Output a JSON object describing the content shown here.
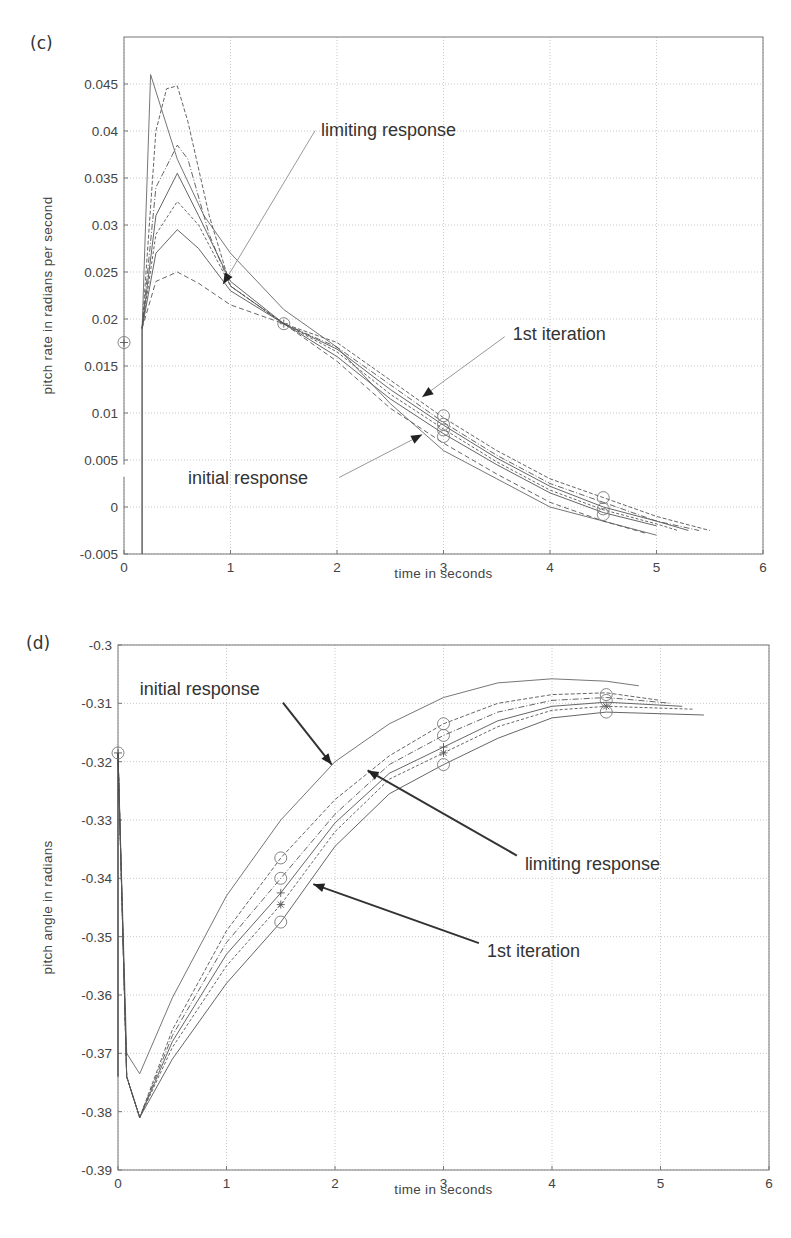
{
  "figure": {
    "panel_c_label": "(c)",
    "panel_d_label": "(d)"
  },
  "chart_data": [
    {
      "type": "line",
      "panel": "(c)",
      "title": "",
      "xlabel": "time in seconds",
      "ylabel": "pitch rate in radians per second",
      "xlim": [
        0,
        6
      ],
      "ylim": [
        -0.005,
        0.05
      ],
      "xticks": [
        "0",
        "1",
        "2",
        "3",
        "4",
        "5",
        "6"
      ],
      "yticks": [
        "-0.005",
        "0",
        "0.005",
        "0.01",
        "0.015",
        "0.02",
        "0.025",
        "0.03",
        "0.035",
        "0.04",
        "0.045"
      ],
      "grid": true,
      "annotations": [
        {
          "text": "limiting response",
          "x": 1.85,
          "y": 0.0395,
          "arrow_to": [
            0.93,
            0.0237
          ]
        },
        {
          "text": "1st iteration",
          "x": 3.65,
          "y": 0.0178,
          "arrow_to": [
            2.8,
            0.0117
          ]
        },
        {
          "text": "initial response",
          "x": 0.6,
          "y": 0.0025,
          "arrow_to": [
            2.8,
            0.0077
          ]
        }
      ],
      "markers": [
        {
          "x": 0.0,
          "y": 0.0175,
          "symbol": "circle-plus"
        },
        {
          "x": 1.5,
          "y": 0.0195,
          "symbol": "circle-plus"
        },
        {
          "x": 3.0,
          "y": 0.0097,
          "symbol": "circle"
        },
        {
          "x": 3.0,
          "y": 0.0088,
          "symbol": "circle"
        },
        {
          "x": 3.0,
          "y": 0.0082,
          "symbol": "circle"
        },
        {
          "x": 3.0,
          "y": 0.0075,
          "symbol": "circle"
        },
        {
          "x": 4.5,
          "y": 0.001,
          "symbol": "circle"
        },
        {
          "x": 4.5,
          "y": -0.0002,
          "symbol": "circle"
        },
        {
          "x": 4.5,
          "y": -0.0008,
          "symbol": "circle"
        }
      ],
      "series": [
        {
          "name": "initial response",
          "x": [
            0.17,
            0.17,
            0.25,
            0.5,
            0.75,
            1.0,
            1.5,
            2.0,
            2.5,
            3.0,
            3.5,
            4.0,
            4.5,
            5.0
          ],
          "y": [
            -0.005,
            0.019,
            0.046,
            0.037,
            0.031,
            0.027,
            0.021,
            0.017,
            0.011,
            0.006,
            0.003,
            0.0,
            -0.0015,
            -0.003
          ]
        },
        {
          "name": "iteration A",
          "x": [
            0.17,
            0.3,
            0.4,
            0.5,
            0.6,
            0.8,
            1.0,
            1.5,
            2.0,
            2.5,
            3.0,
            3.5,
            4.0,
            4.5,
            5.0,
            5.5
          ],
          "y": [
            0.019,
            0.04,
            0.0445,
            0.0448,
            0.041,
            0.031,
            0.0235,
            0.0195,
            0.0175,
            0.0135,
            0.0095,
            0.006,
            0.003,
            0.001,
            -0.001,
            -0.0025
          ]
        },
        {
          "name": "iteration B",
          "x": [
            0.17,
            0.3,
            0.5,
            0.6,
            0.8,
            1.0,
            1.5,
            2.0,
            2.5,
            3.0,
            3.5,
            4.0,
            4.5,
            5.0,
            5.4
          ],
          "y": [
            0.019,
            0.034,
            0.0385,
            0.037,
            0.029,
            0.0235,
            0.0195,
            0.017,
            0.013,
            0.009,
            0.0055,
            0.0025,
            0.0005,
            -0.0015,
            -0.0025
          ]
        },
        {
          "name": "iteration C",
          "x": [
            0.17,
            0.3,
            0.5,
            0.7,
            1.0,
            1.5,
            2.0,
            2.5,
            3.0,
            3.5,
            4.0,
            4.5,
            5.0,
            5.3
          ],
          "y": [
            0.019,
            0.031,
            0.0355,
            0.031,
            0.024,
            0.0195,
            0.0168,
            0.0125,
            0.0087,
            0.0052,
            0.0022,
            0.0,
            -0.0015,
            -0.0025
          ]
        },
        {
          "name": "iteration D",
          "x": [
            0.17,
            0.3,
            0.5,
            0.7,
            1.0,
            1.5,
            2.0,
            2.5,
            3.0,
            3.5,
            4.0,
            4.5,
            5.0,
            5.2
          ],
          "y": [
            0.019,
            0.029,
            0.0325,
            0.03,
            0.0235,
            0.0195,
            0.0165,
            0.012,
            0.0083,
            0.0048,
            0.0018,
            -0.0003,
            -0.0018,
            -0.0025
          ]
        },
        {
          "name": "limiting response",
          "x": [
            0.17,
            0.3,
            0.5,
            0.7,
            1.0,
            1.5,
            2.0,
            2.5,
            3.0,
            3.5,
            4.0,
            4.5,
            5.0
          ],
          "y": [
            0.019,
            0.027,
            0.0295,
            0.0275,
            0.023,
            0.0195,
            0.016,
            0.0115,
            0.0078,
            0.0045,
            0.0015,
            -0.0006,
            -0.002
          ]
        },
        {
          "name": "1st iteration",
          "x": [
            0.17,
            0.3,
            0.5,
            0.7,
            1.0,
            1.5,
            2.0,
            2.5,
            3.0,
            3.5,
            4.0,
            4.5,
            4.9
          ],
          "y": [
            0.019,
            0.024,
            0.025,
            0.0238,
            0.0215,
            0.0195,
            0.0155,
            0.0105,
            0.0068,
            0.0035,
            0.0005,
            -0.0015,
            -0.0028
          ]
        }
      ]
    },
    {
      "type": "line",
      "panel": "(d)",
      "title": "",
      "xlabel": "time in seconds",
      "ylabel": "pitch angle in radians",
      "xlim": [
        0,
        6
      ],
      "ylim": [
        -0.39,
        -0.3
      ],
      "xticks": [
        "0",
        "1",
        "2",
        "3",
        "4",
        "5",
        "6"
      ],
      "yticks": [
        "-0.3",
        "-0.31",
        "-0.32",
        "-0.33",
        "-0.34",
        "-0.35",
        "-0.36",
        "-0.37",
        "-0.38",
        "-0.39"
      ],
      "grid": true,
      "annotations": [
        {
          "text": "initial response",
          "x": 0.2,
          "y": -0.3085,
          "arrow_to": [
            1.97,
            -0.3205
          ]
        },
        {
          "text": "limiting response",
          "x": 3.75,
          "y": -0.3385,
          "arrow_to": [
            2.3,
            -0.3215
          ]
        },
        {
          "text": "1st iteration",
          "x": 3.4,
          "y": -0.3535,
          "arrow_to": [
            1.8,
            -0.341
          ]
        }
      ],
      "markers": [
        {
          "x": 0.0,
          "y": -0.3185,
          "symbol": "circle-plus"
        },
        {
          "x": 1.5,
          "y": -0.3365,
          "symbol": "circle"
        },
        {
          "x": 1.5,
          "y": -0.34,
          "symbol": "circle"
        },
        {
          "x": 1.5,
          "y": -0.3425,
          "symbol": "plus"
        },
        {
          "x": 1.5,
          "y": -0.3445,
          "symbol": "star"
        },
        {
          "x": 1.5,
          "y": -0.3475,
          "symbol": "circle"
        },
        {
          "x": 3.0,
          "y": -0.3135,
          "symbol": "circle"
        },
        {
          "x": 3.0,
          "y": -0.3155,
          "symbol": "circle"
        },
        {
          "x": 3.0,
          "y": -0.3175,
          "symbol": "plus"
        },
        {
          "x": 3.0,
          "y": -0.3185,
          "symbol": "star"
        },
        {
          "x": 3.0,
          "y": -0.3205,
          "symbol": "circle"
        },
        {
          "x": 4.5,
          "y": -0.3085,
          "symbol": "circle"
        },
        {
          "x": 4.5,
          "y": -0.3095,
          "symbol": "circle"
        },
        {
          "x": 4.5,
          "y": -0.3105,
          "symbol": "star"
        },
        {
          "x": 4.5,
          "y": -0.3115,
          "symbol": "circle"
        }
      ],
      "series": [
        {
          "name": "initial response",
          "x": [
            0.0,
            0.08,
            0.2,
            0.5,
            1.0,
            1.5,
            2.0,
            2.5,
            3.0,
            3.5,
            4.0,
            4.5,
            4.8
          ],
          "y": [
            -0.3185,
            -0.37,
            -0.3735,
            -0.3605,
            -0.343,
            -0.33,
            -0.32,
            -0.3135,
            -0.309,
            -0.3065,
            -0.3058,
            -0.3062,
            -0.307
          ]
        },
        {
          "name": "iteration A",
          "x": [
            0.0,
            0.08,
            0.2,
            0.5,
            1.0,
            1.5,
            2.0,
            2.5,
            3.0,
            3.5,
            4.0,
            4.5,
            5.0
          ],
          "y": [
            -0.3185,
            -0.374,
            -0.381,
            -0.366,
            -0.349,
            -0.3365,
            -0.3265,
            -0.319,
            -0.3135,
            -0.31,
            -0.3085,
            -0.3082,
            -0.3095
          ]
        },
        {
          "name": "iteration B",
          "x": [
            0.0,
            0.08,
            0.2,
            0.5,
            1.0,
            1.5,
            2.0,
            2.5,
            3.0,
            3.5,
            4.0,
            4.5,
            5.1
          ],
          "y": [
            -0.3185,
            -0.374,
            -0.381,
            -0.367,
            -0.351,
            -0.34,
            -0.329,
            -0.3205,
            -0.3155,
            -0.3115,
            -0.3095,
            -0.309,
            -0.31
          ]
        },
        {
          "name": "iteration C",
          "x": [
            0.0,
            0.08,
            0.2,
            0.5,
            1.0,
            1.5,
            2.0,
            2.5,
            3.0,
            3.5,
            4.0,
            4.5,
            5.2
          ],
          "y": [
            -0.3185,
            -0.374,
            -0.381,
            -0.368,
            -0.353,
            -0.3425,
            -0.3305,
            -0.322,
            -0.3175,
            -0.313,
            -0.3105,
            -0.3098,
            -0.3105
          ]
        },
        {
          "name": "limiting response",
          "x": [
            0.0,
            0.08,
            0.2,
            0.5,
            1.0,
            1.5,
            2.0,
            2.5,
            3.0,
            3.5,
            4.0,
            4.5,
            5.3
          ],
          "y": [
            -0.3185,
            -0.374,
            -0.381,
            -0.369,
            -0.355,
            -0.3445,
            -0.332,
            -0.323,
            -0.3185,
            -0.314,
            -0.3112,
            -0.3105,
            -0.311
          ]
        },
        {
          "name": "1st iteration",
          "x": [
            0.0,
            0.08,
            0.2,
            0.5,
            1.0,
            1.5,
            2.0,
            2.5,
            3.0,
            3.5,
            4.0,
            4.5,
            5.4
          ],
          "y": [
            -0.3185,
            -0.374,
            -0.381,
            -0.371,
            -0.358,
            -0.3475,
            -0.3345,
            -0.3255,
            -0.3205,
            -0.316,
            -0.3125,
            -0.3115,
            -0.312
          ]
        }
      ]
    }
  ]
}
